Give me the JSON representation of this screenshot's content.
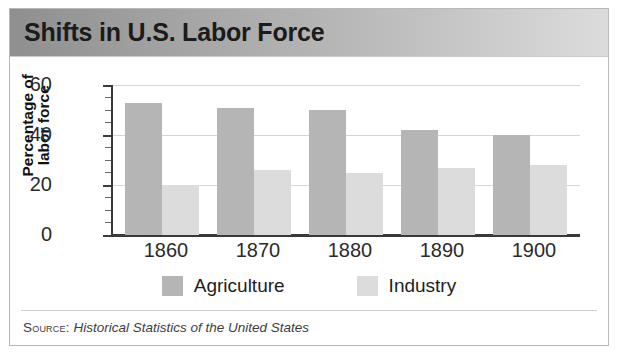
{
  "figure": {
    "title": "Shifts in U.S. Labor Force",
    "source_label": "Source:",
    "source_text": "Historical Statistics of the United States"
  },
  "colors": {
    "agriculture": "#b5b5b5",
    "industry": "#dcdcdc",
    "axis": "#3a3a3a",
    "gridline": "#d5d5d5",
    "title_bar_from": "#8f8f8f",
    "title_bar_to": "#dcdcdc",
    "frame_border": "#b9b9b9"
  },
  "chart_data": {
    "type": "bar",
    "title": "Shifts in U.S. Labor Force",
    "subtitle": "",
    "xlabel": "",
    "ylabel": "Percentage of labor force",
    "ylabel_lines": [
      "Percentage of",
      "labor force"
    ],
    "categories": [
      "1860",
      "1870",
      "1880",
      "1890",
      "1900"
    ],
    "series": [
      {
        "name": "Agriculture",
        "color": "#b5b5b5",
        "values": [
          53,
          51,
          50,
          42,
          40
        ]
      },
      {
        "name": "Industry",
        "color": "#dcdcdc",
        "values": [
          20,
          26,
          25,
          27,
          28
        ]
      }
    ],
    "ylim": [
      0,
      60
    ],
    "yticks": [
      0,
      20,
      40,
      60
    ],
    "ytick_labels": [
      "0",
      "20",
      "40",
      "60"
    ],
    "minor_tick_step": 5,
    "grid": true,
    "grid_axis": "y",
    "legend": [
      "Agriculture",
      "Industry"
    ],
    "legend_position": "bottom-center",
    "source": "Source: Historical Statistics of the United States"
  }
}
